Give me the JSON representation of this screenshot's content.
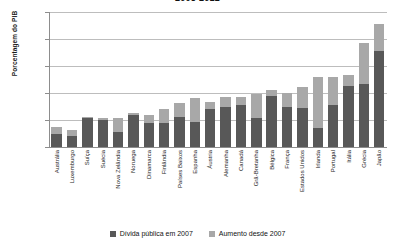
{
  "chart_data": {
    "type": "bar",
    "title": "2008-2012",
    "xlabel": "",
    "ylabel": "Porcentagem do PIB",
    "ylim": [
      -10,
      240
    ],
    "yticks": [
      -10,
      40,
      90,
      140,
      190,
      240
    ],
    "grid": true,
    "stacked": true,
    "legend_position": "bottom",
    "categories": [
      "Austrália",
      "Luxemburgo",
      "Suíça",
      "Suécia",
      "Nova Zelândia",
      "Noruega",
      "Dinamarca",
      "Finlândia",
      "Países Baixos",
      "Espanha",
      "Áustria",
      "Alemanha",
      "Canadá",
      "Grã-Bretanha",
      "Bélgica",
      "França",
      "Estados Unidos",
      "Irlanda",
      "Portugal",
      "Itália",
      "Grécia",
      "Japão"
    ],
    "series": [
      {
        "name": "Dívida pública em 2007",
        "color": "#585858",
        "values": [
          14,
          11,
          44,
          40,
          18,
          50,
          34,
          35,
          45,
          36,
          60,
          65,
          67,
          44,
          84,
          64,
          62,
          25,
          68,
          103,
          107,
          167
        ]
      },
      {
        "name": "Aumento desde 2007",
        "color": "#a8a8a8",
        "values": [
          13,
          11,
          2,
          4,
          26,
          3,
          15,
          25,
          26,
          45,
          14,
          17,
          16,
          44,
          11,
          26,
          40,
          95,
          52,
          20,
          76,
          51
        ]
      }
    ],
    "totals": [
      27,
      22,
      46,
      44,
      44,
      53,
      49,
      60,
      71,
      81,
      74,
      82,
      83,
      88,
      95,
      90,
      102,
      120,
      120,
      123,
      183,
      218
    ]
  },
  "legend": {
    "items": [
      {
        "label": "Dívida pública em 2007",
        "swatch": "dark"
      },
      {
        "label": "Aumento desde 2007",
        "swatch": "light"
      }
    ]
  }
}
